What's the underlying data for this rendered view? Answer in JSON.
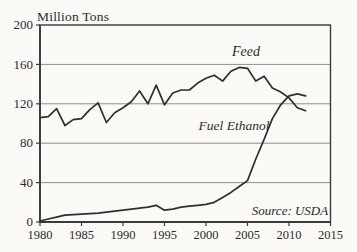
{
  "page": {
    "background": "#fbfaf7",
    "axis_color": "#3a3a3a",
    "grid_color": "#8f8f8f",
    "line_color": "#2f2f2f",
    "text_color": "#2a2a2a"
  },
  "labels": {
    "y_axis_title": "Million Tons",
    "feed_series_label": "Feed",
    "ethanol_series_label": "Fuel Ethanol",
    "source_note": "Source: USDA"
  },
  "chart_data": {
    "type": "line",
    "title": "Million Tons",
    "xlabel": "",
    "ylabel": "Million Tons",
    "xlim": [
      1980,
      2015
    ],
    "ylim": [
      0,
      200
    ],
    "x_ticks": [
      1980,
      1985,
      1990,
      1995,
      2000,
      2005,
      2010,
      2015
    ],
    "y_ticks": [
      0,
      40,
      80,
      120,
      160,
      200
    ],
    "grid": "horizontal",
    "legend_position": "inline-annotations",
    "annotations": [
      "Feed",
      "Fuel Ethanol",
      "Source: USDA"
    ],
    "x": [
      1980,
      1981,
      1982,
      1983,
      1984,
      1985,
      1986,
      1987,
      1988,
      1989,
      1990,
      1991,
      1992,
      1993,
      1994,
      1995,
      1996,
      1997,
      1998,
      1999,
      2000,
      2001,
      2002,
      2003,
      2004,
      2005,
      2006,
      2007,
      2008,
      2009,
      2010,
      2011,
      2012
    ],
    "series": [
      {
        "name": "Feed",
        "values": [
          106,
          107,
          115,
          98,
          104,
          105,
          114,
          121,
          101,
          111,
          116,
          122,
          133,
          120,
          139,
          119,
          131,
          134,
          134,
          141,
          146,
          149,
          143,
          153,
          157,
          156,
          143,
          148,
          136,
          132,
          126,
          116,
          113
        ]
      },
      {
        "name": "Fuel Ethanol",
        "values": [
          1,
          3,
          5,
          7,
          7.5,
          8,
          8.5,
          9,
          10,
          11,
          12,
          13,
          14,
          15,
          17,
          12,
          13,
          15,
          16,
          17,
          18,
          20,
          25,
          30,
          36,
          42,
          64,
          84,
          105,
          119,
          128,
          130,
          128
        ]
      }
    ]
  }
}
